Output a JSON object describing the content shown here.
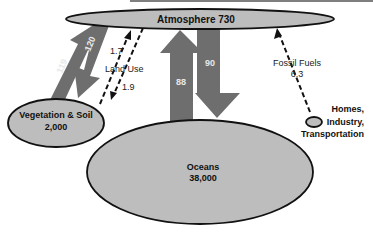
{
  "diagram": {
    "type": "carbon-cycle",
    "nodes": {
      "atmosphere": {
        "label": "Atmosphere 730"
      },
      "vegetation": {
        "label": "Vegetation & Soil",
        "value": "2,000"
      },
      "oceans": {
        "label": "Oceans",
        "value": "38,000"
      },
      "homes": {
        "line1": "Homes,",
        "line2": "Industry,",
        "line3": "Transportation"
      }
    },
    "flows": {
      "veg_to_atm": "119",
      "atm_to_veg": "120",
      "land_use_up": "1.7",
      "land_use_label": "Land Use",
      "land_use_down": "1.9",
      "ocean_to_atm": "88",
      "atm_to_ocean": "90",
      "fossil_label": "Fossil Fuels",
      "fossil_value": "6.3"
    },
    "colors": {
      "ellipse_fill": "#bdbdbd",
      "arrow_fill": "#6e6e6e",
      "outline": "#111111",
      "arrow_text": "#e8e8e8"
    }
  }
}
